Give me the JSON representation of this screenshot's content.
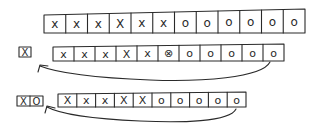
{
  "diagram": {
    "rows": [
      {
        "name": "row-1",
        "pile": [],
        "cells": [
          "x",
          "x",
          "x",
          "X",
          "x",
          "x",
          "o",
          "o",
          "o",
          "o",
          "o",
          "o"
        ]
      },
      {
        "name": "row-2",
        "pile": [
          "X"
        ],
        "cells": [
          "x",
          "x",
          "x",
          "X",
          "x",
          "⊗",
          "o",
          "o",
          "o",
          "o",
          "o"
        ],
        "arrow": "from last cell back to pile"
      },
      {
        "name": "row-3",
        "pile": [
          "X",
          "O"
        ],
        "cells": [
          "X",
          "x",
          "x",
          "X",
          "X",
          "o",
          "o",
          "o",
          "o",
          "o"
        ],
        "arrow": "from last cell back to pile"
      }
    ]
  }
}
